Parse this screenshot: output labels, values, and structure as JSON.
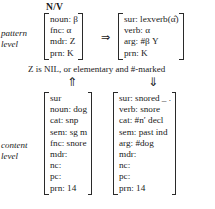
{
  "diagram": {
    "category_header": "N/V",
    "pattern_level_label": [
      "pattern",
      "level"
    ],
    "content_level_label": [
      "content",
      "level"
    ],
    "condition": "Z is NIL, or elementary and #-marked",
    "implies_arrow": "⇒",
    "up_arrow": "⇑",
    "down_arrow": "⇓",
    "pattern_left": {
      "rows": [
        "noun: β",
        "fnc: α",
        "mdr: Z",
        "prn: K"
      ]
    },
    "pattern_right": {
      "rows": [
        "sur: lexverb(α̂)",
        "verb: α",
        "arg: #β Y",
        "prn: K"
      ]
    },
    "content_left": {
      "rows": [
        "sur",
        "noun: dog",
        "cat: snp",
        "sem: sg m",
        "fnc: snore",
        "mdr:",
        "nc:",
        "pc:",
        "prn: 14"
      ]
    },
    "content_right": {
      "rows": [
        "sur: snored _ .",
        "verb: snore",
        "cat: #n′ decl",
        "sem: past ind",
        "arg: #dog",
        "mdr:",
        "nc:",
        "pc:",
        "prn: 14"
      ]
    }
  }
}
